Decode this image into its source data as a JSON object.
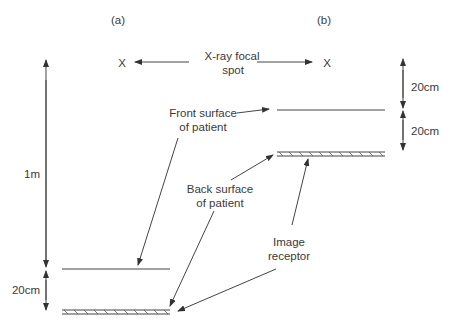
{
  "panels": {
    "a": {
      "label": "(a)"
    },
    "b": {
      "label": "(b)"
    }
  },
  "focal_spot": {
    "marker": "X",
    "label_line1": "X-ray focal",
    "label_line2": "spot"
  },
  "front_surface": {
    "label_line1": "Front surface",
    "label_line2": "of patient"
  },
  "back_surface": {
    "label_line1": "Back surface",
    "label_line2": "of patient"
  },
  "image_receptor": {
    "label_line1": "Image",
    "label_line2": "receptor"
  },
  "dimensions": {
    "a_source_to_patient": "1m",
    "a_patient_to_receptor": "20cm",
    "b_source_to_patient": "20cm",
    "b_patient_to_receptor": "20cm"
  },
  "colors": {
    "line": "#444444",
    "text": "#3a3a3a",
    "background": "#ffffff"
  }
}
